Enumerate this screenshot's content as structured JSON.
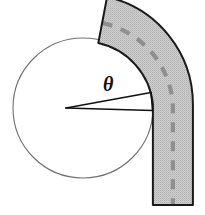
{
  "figure": {
    "type": "geometry-diagram",
    "canvas": {
      "width": 205,
      "height": 215,
      "background": "#ffffff"
    },
    "angle_label": {
      "symbol": "θ",
      "name": "theta",
      "x": 103,
      "y": 74,
      "font_size": 20,
      "color": "#111111"
    },
    "circle": {
      "name": "base-circle",
      "cx": 83,
      "cy": 108,
      "r": 70,
      "stroke": "#6f6f6f",
      "stroke_width": 1.1,
      "fill": "none"
    },
    "band": {
      "name": "curved-band",
      "fill": "#c9c9c9",
      "stroke": "#1a1a1a",
      "stroke_width": 2.0,
      "inner_radius": 70,
      "outer_radius": 110,
      "start_angle_deg": -64,
      "end_angle_deg": 3,
      "bottom_cut": "horizontal",
      "bottom_y": 205
    },
    "centerline": {
      "name": "band-centerline",
      "stroke": "#8c8c8c",
      "stroke_width": 4,
      "dash": "10 9",
      "radius": 90
    },
    "angle_rays": {
      "name": "angle-rays",
      "stroke": "#111111",
      "stroke_width": 1.6,
      "vertex": {
        "x": 66,
        "y": 108
      },
      "upper_ray_end": {
        "x": 151,
        "y": 93
      },
      "lower_ray_end": {
        "x": 152,
        "y": 111
      }
    },
    "texture": {
      "name": "band-stipple",
      "dot_color": "#b3b3b3",
      "spacing": 2
    }
  }
}
